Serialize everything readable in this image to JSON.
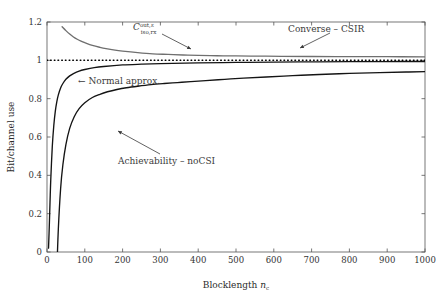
{
  "chart_data": {
    "type": "line",
    "title": "",
    "xlabel": "Blocklength n_c",
    "ylabel": "Bit/channel use",
    "xlim": [
      0,
      1000
    ],
    "ylim": [
      0,
      1.2
    ],
    "grid": false,
    "legend_position": "none (inline annotations)",
    "xticks": [
      0,
      100,
      200,
      300,
      400,
      500,
      600,
      700,
      800,
      900,
      1000
    ],
    "xticklabels": [
      "0",
      "100",
      "200",
      "300",
      "400",
      "500",
      "600",
      "700",
      "800",
      "900",
      "1000"
    ],
    "yticks": [
      0,
      0.2,
      0.4,
      0.6,
      0.8,
      1,
      1.2
    ],
    "yticklabels": [
      "0",
      "0.2",
      "0.4",
      "0.6",
      "0.8",
      "1",
      "1.2"
    ],
    "series": [
      {
        "name": "Converse - CSIR",
        "color": "#6f6f6f",
        "style": "solid",
        "x": [
          40,
          50,
          60,
          70,
          80,
          90,
          100,
          120,
          140,
          160,
          180,
          200,
          240,
          280,
          320,
          360,
          400,
          450,
          500,
          560,
          620,
          700,
          800,
          900,
          1000
        ],
        "y": [
          1.175,
          1.155,
          1.137,
          1.122,
          1.11,
          1.1,
          1.092,
          1.078,
          1.068,
          1.06,
          1.053,
          1.048,
          1.04,
          1.034,
          1.031,
          1.028,
          1.026,
          1.024,
          1.023,
          1.022,
          1.021,
          1.02,
          1.019,
          1.019,
          1.018
        ]
      },
      {
        "name": "Normal approx.",
        "color": "#141414",
        "style": "solid",
        "x": [
          4,
          6,
          8,
          10,
          14,
          18,
          22,
          26,
          30,
          36,
          42,
          50,
          60,
          70,
          85,
          100,
          125,
          150,
          200,
          250,
          300,
          400,
          500,
          600,
          700,
          800,
          900,
          1000
        ],
        "y": [
          0.02,
          0.13,
          0.26,
          0.38,
          0.55,
          0.66,
          0.735,
          0.785,
          0.82,
          0.856,
          0.879,
          0.901,
          0.919,
          0.931,
          0.944,
          0.952,
          0.962,
          0.968,
          0.976,
          0.98,
          0.983,
          0.987,
          0.989,
          0.991,
          0.992,
          0.993,
          0.9935,
          0.994
        ]
      },
      {
        "name": "Achievability - noCSI",
        "color": "#141414",
        "style": "solid",
        "x": [
          26,
          30,
          36,
          42,
          50,
          60,
          72,
          85,
          100,
          120,
          140,
          160,
          185,
          210,
          240,
          275,
          310,
          345,
          380,
          420,
          470,
          520,
          580,
          650,
          720,
          800,
          880,
          950,
          1000
        ],
        "y": [
          -0.1,
          0.12,
          0.33,
          0.455,
          0.56,
          0.645,
          0.706,
          0.748,
          0.779,
          0.806,
          0.823,
          0.836,
          0.848,
          0.857,
          0.865,
          0.873,
          0.879,
          0.884,
          0.889,
          0.894,
          0.901,
          0.907,
          0.913,
          0.92,
          0.926,
          0.932,
          0.936,
          0.939,
          0.941
        ]
      },
      {
        "name": "Capacity reference line",
        "color": "#000000",
        "style": "dotted",
        "x": [
          0,
          1000
        ],
        "y": [
          1.0,
          1.0
        ]
      }
    ],
    "annotations": [
      {
        "name": "c-iso-rx-label",
        "base": "C",
        "superscript": "out,ε",
        "subscript": "iso,rx",
        "x_px": 133,
        "y_px": 27,
        "arrow_from": [
          162,
          34
        ],
        "arrow_to": [
          191,
          49
        ]
      },
      {
        "name": "converse-csir-label",
        "text": "Converse – CSIR",
        "x_px": 288,
        "y_px": 29,
        "arrow_from": [
          330,
          33
        ],
        "arrow_to": [
          300,
          48
        ]
      },
      {
        "name": "normal-approx-label",
        "text": "Normal approx.",
        "arrow_glyph": "←",
        "x_px": 92,
        "y_px": 81,
        "arrow_from": [
          90,
          78
        ],
        "arrow_to": [
          74,
          78
        ]
      },
      {
        "name": "achievability-nocsi-label",
        "text": "Achievability – noCSI",
        "x_px": 118,
        "y_px": 161,
        "arrow_from": [
          160,
          154
        ],
        "arrow_to": [
          118,
          131
        ]
      }
    ]
  },
  "axes": {
    "x_label_main": "Blocklength",
    "x_label_var": "n",
    "x_label_var_sub": "c",
    "y_label": "Bit/channel use"
  }
}
